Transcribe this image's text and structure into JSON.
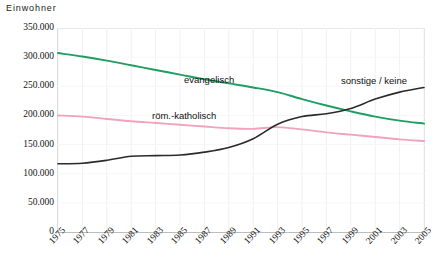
{
  "chart_data": {
    "type": "line",
    "title": "",
    "ylabel": "Einwohner",
    "xlabel": "",
    "ylim": [
      0,
      350000
    ],
    "ytick_labels": [
      "350.000",
      "300.000",
      "250.000",
      "200.000",
      "150.000",
      "100.000",
      "50.000",
      "0"
    ],
    "ytick_values": [
      350000,
      300000,
      250000,
      200000,
      150000,
      100000,
      50000,
      0
    ],
    "grid": true,
    "legend_position": "inline-labels",
    "x": [
      1975,
      1977,
      1979,
      1981,
      1983,
      1985,
      1987,
      1989,
      1991,
      1993,
      1995,
      1997,
      1999,
      2001,
      2003,
      2005
    ],
    "xtick_labels": [
      "1975",
      "1977",
      "1979",
      "1981",
      "1983",
      "1985",
      "1987",
      "1989",
      "1991",
      "1993",
      "1995",
      "1997",
      "1999",
      "2001",
      "2003",
      "2005"
    ],
    "series": [
      {
        "name": "evangelisch",
        "color": "#1f9e63",
        "values": [
          307000,
          301000,
          294000,
          286000,
          278000,
          270000,
          262000,
          255000,
          248000,
          240000,
          228000,
          217000,
          207000,
          198000,
          191000,
          186000
        ]
      },
      {
        "name": "röm.-katholisch",
        "color": "#f0a4bc",
        "values": [
          200000,
          198000,
          194000,
          190000,
          187000,
          184000,
          181000,
          178000,
          177000,
          180000,
          176000,
          171000,
          167000,
          163000,
          159000,
          156000
        ]
      },
      {
        "name": "sonstige / keine",
        "color": "#2b2b2b",
        "values": [
          117000,
          118000,
          123000,
          130000,
          131000,
          132000,
          137000,
          145000,
          160000,
          185000,
          198000,
          203000,
          212000,
          228000,
          240000,
          248000
        ]
      }
    ]
  },
  "series_labels": [
    {
      "text": "evangelisch",
      "name": "series-label-evangelisch"
    },
    {
      "text": "röm.-katholisch",
      "name": "series-label-roem-katholisch"
    },
    {
      "text": "sonstige / keine",
      "name": "series-label-sonstige-keine"
    }
  ]
}
